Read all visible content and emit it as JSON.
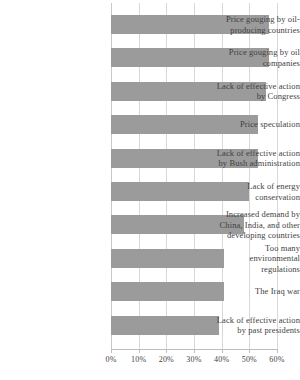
{
  "chart_data": {
    "type": "bar",
    "orientation": "horizontal",
    "title": "",
    "subtitle": "",
    "xlabel": "",
    "ylabel": "",
    "xlim": [
      0,
      60
    ],
    "grid": true,
    "legend": null,
    "categories": [
      "Price gouging by oil-producing countries",
      "Price gouging by oil companies",
      "Lack of effective action by Congress",
      "Price speculation",
      "Lack of effective action by Bush administration",
      "Lack of energy conservation",
      "Increased demand by China, India, and other developing countries",
      "Too many environmental regulations",
      "The Iraq war",
      "Lack of effective action by past presidents"
    ],
    "category_lines": [
      [
        "Price gouging by oil-",
        "producing countries"
      ],
      [
        "Price gouging by oil",
        "companies"
      ],
      [
        "Lack of effective action",
        "by Congress"
      ],
      [
        "Price speculation"
      ],
      [
        "Lack of effective action",
        "by Bush administration"
      ],
      [
        "Lack of energy",
        "conservation"
      ],
      [
        "Increased demand by",
        "China, India, and other",
        "developing countries"
      ],
      [
        "Too many",
        "environmental",
        "regulations"
      ],
      [
        "The Iraq war"
      ],
      [
        "Lack of effective action",
        "by past presidents"
      ]
    ],
    "values": [
      57,
      57,
      56,
      53,
      53,
      50,
      48,
      41,
      41,
      39
    ],
    "xticks": [
      0,
      10,
      20,
      30,
      40,
      50,
      60
    ],
    "xticklabels": [
      "0%",
      "10%",
      "20%",
      "30%",
      "40%",
      "50%",
      "60%"
    ],
    "bar_color": "#9b9b9b",
    "gridline_color": "#d8d8d8",
    "axis_color": "#bdbdbd",
    "text_color": "#3f3f3f",
    "background_color": "#ffffff"
  }
}
